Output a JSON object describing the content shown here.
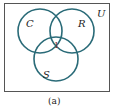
{
  "diagram": {
    "type": "venn",
    "universe_label": "U",
    "sets": [
      {
        "name": "C",
        "cx": 40,
        "cy": 31,
        "r": 22
      },
      {
        "name": "R",
        "cx": 72,
        "cy": 31,
        "r": 22
      },
      {
        "name": "S",
        "cx": 56,
        "cy": 59,
        "r": 22
      }
    ],
    "regions": [
      {
        "label": "1",
        "location": "C∩R∩S"
      }
    ],
    "caption": "(a)",
    "colors": {
      "stroke": "#2a6b78",
      "border": "#555555",
      "region_label": "#7a2a2a"
    }
  }
}
